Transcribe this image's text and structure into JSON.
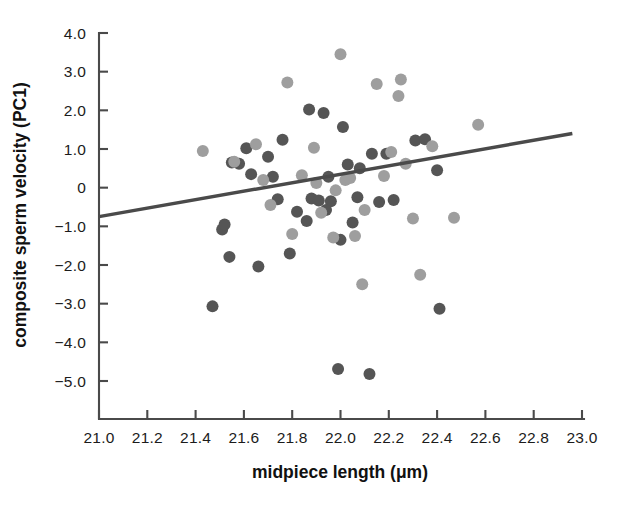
{
  "chart_data": {
    "type": "scatter",
    "title": "",
    "xlabel": "midpiece length (μm)",
    "ylabel": "composite sperm velocity (PC1)",
    "xlim": [
      21.0,
      23.0
    ],
    "ylim": [
      -5.6,
      4.0
    ],
    "xticks": [
      21.0,
      21.2,
      21.4,
      21.6,
      21.8,
      22.0,
      22.2,
      22.4,
      22.6,
      22.8,
      23.0
    ],
    "xticklabels": [
      "21.0",
      "21.2",
      "21.4",
      "21.6",
      "21.8",
      "22.0",
      "22.2",
      "22.4",
      "22.6",
      "22.8",
      "23.0"
    ],
    "yticks": [
      4.0,
      3.0,
      2.0,
      1.0,
      0.0,
      -1.0,
      -2.0,
      -3.0,
      -4.0,
      -5.0
    ],
    "yticklabels": [
      "4.0",
      "3.0",
      "2.0",
      "1.0",
      "0",
      "−1.0",
      "−2.0",
      "−3.0",
      "−4.0",
      "−5.0"
    ],
    "grid": false,
    "legend": "none",
    "marker_radius_px": 6.0,
    "colors": {
      "dark_marker": "#555555",
      "light_marker": "#9e9e9e",
      "fit_line": "#4a4a4a",
      "axis": "#4a4a4a",
      "text": "#1b1b1b",
      "background": "#ffffff"
    },
    "trendline": {
      "name": "linear fit",
      "x_start": 21.0,
      "y_start": -0.75,
      "x_end": 22.96,
      "y_end": 1.4,
      "color": "#4a4a4a"
    },
    "series": [
      {
        "name": "dark points",
        "color": "#555555",
        "points": [
          [
            21.47,
            -3.07
          ],
          [
            21.54,
            -1.79
          ],
          [
            21.51,
            -1.08
          ],
          [
            21.52,
            -0.95
          ],
          [
            21.55,
            0.65
          ],
          [
            21.58,
            0.62
          ],
          [
            21.61,
            1.02
          ],
          [
            21.66,
            -2.04
          ],
          [
            21.63,
            0.35
          ],
          [
            21.7,
            0.8
          ],
          [
            21.72,
            0.28
          ],
          [
            21.74,
            -0.3
          ],
          [
            21.76,
            1.24
          ],
          [
            21.79,
            -1.7
          ],
          [
            21.82,
            -0.62
          ],
          [
            21.86,
            -0.86
          ],
          [
            21.87,
            2.02
          ],
          [
            21.88,
            -0.28
          ],
          [
            21.91,
            -0.33
          ],
          [
            21.93,
            1.93
          ],
          [
            21.95,
            0.28
          ],
          [
            21.96,
            -0.35
          ],
          [
            21.94,
            -0.58
          ],
          [
            21.99,
            -4.69
          ],
          [
            22.0,
            -1.35
          ],
          [
            22.01,
            1.57
          ],
          [
            22.03,
            0.6
          ],
          [
            22.05,
            -0.9
          ],
          [
            22.08,
            0.5
          ],
          [
            22.07,
            -0.25
          ],
          [
            22.12,
            -4.82
          ],
          [
            22.13,
            0.88
          ],
          [
            22.16,
            -0.37
          ],
          [
            22.19,
            0.88
          ],
          [
            22.22,
            -0.32
          ],
          [
            22.31,
            1.22
          ],
          [
            22.35,
            1.25
          ],
          [
            22.41,
            -3.13
          ],
          [
            22.4,
            0.45
          ]
        ]
      },
      {
        "name": "light points",
        "color": "#9e9e9e",
        "points": [
          [
            21.43,
            0.95
          ],
          [
            21.56,
            0.67
          ],
          [
            21.65,
            1.12
          ],
          [
            21.68,
            0.2
          ],
          [
            21.71,
            -0.45
          ],
          [
            21.78,
            2.72
          ],
          [
            21.8,
            -1.2
          ],
          [
            21.84,
            0.32
          ],
          [
            21.89,
            1.03
          ],
          [
            21.9,
            0.12
          ],
          [
            21.92,
            -0.65
          ],
          [
            21.97,
            -1.29
          ],
          [
            22.0,
            3.45
          ],
          [
            21.98,
            -0.07
          ],
          [
            22.02,
            0.2
          ],
          [
            22.04,
            0.25
          ],
          [
            22.06,
            -1.25
          ],
          [
            22.1,
            -0.58
          ],
          [
            22.09,
            -2.5
          ],
          [
            22.15,
            2.68
          ],
          [
            22.18,
            0.3
          ],
          [
            22.21,
            0.92
          ],
          [
            22.25,
            2.8
          ],
          [
            22.24,
            2.37
          ],
          [
            22.27,
            0.62
          ],
          [
            22.3,
            -0.8
          ],
          [
            22.33,
            -2.25
          ],
          [
            22.38,
            1.07
          ],
          [
            22.47,
            -0.78
          ],
          [
            22.57,
            1.63
          ]
        ]
      }
    ]
  }
}
